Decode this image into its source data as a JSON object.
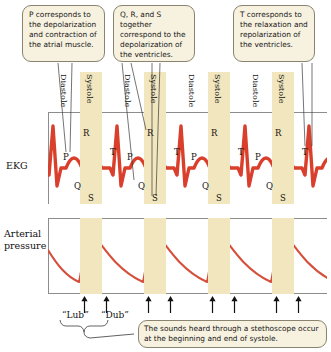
{
  "figure": {
    "accent_red": "#d93f2b",
    "band_color": "#f2e6bf",
    "callout_fill": "#f7f2e0",
    "callout_border": "#8a8370"
  },
  "callouts": {
    "p_wave": "P corresponds to the depolarization and contraction of the atrial muscle.",
    "qrs_complex": "Q, R, and S together correspond to the depolarization of the ventricles.",
    "t_wave": "T corresponds to the relaxation and repolarization of the ventricles.",
    "heart_sounds": "The sounds heard through a stethoscope occur at the beginning and end of systole."
  },
  "axis_titles": {
    "ekg": "EKG",
    "arterial_pressure_line1": "Arterial",
    "arterial_pressure_line2": "pressure"
  },
  "cycle_phases": [
    {
      "label": "Diastole",
      "x": 60
    },
    {
      "label": "Systole",
      "x": 86
    },
    {
      "label": "Diastole",
      "x": 124
    },
    {
      "label": "Systole",
      "x": 150
    },
    {
      "label": "Diastole",
      "x": 188
    },
    {
      "label": "Systole",
      "x": 214
    },
    {
      "label": "Diastole",
      "x": 252
    },
    {
      "label": "Systole",
      "x": 278
    }
  ],
  "systole_bands": [
    {
      "x": 80,
      "width": 22
    },
    {
      "x": 144,
      "width": 22
    },
    {
      "x": 208,
      "width": 22
    },
    {
      "x": 272,
      "width": 22
    }
  ],
  "wave_letters": [
    {
      "letter": "P",
      "x": 63,
      "y": 152
    },
    {
      "letter": "R",
      "x": 83,
      "y": 128
    },
    {
      "letter": "Q",
      "x": 74,
      "y": 181
    },
    {
      "letter": "S",
      "x": 88,
      "y": 193
    },
    {
      "letter": "T",
      "x": 110,
      "y": 147
    },
    {
      "letter": "P",
      "x": 127,
      "y": 152
    },
    {
      "letter": "R",
      "x": 147,
      "y": 128
    },
    {
      "letter": "Q",
      "x": 138,
      "y": 181
    },
    {
      "letter": "S",
      "x": 152,
      "y": 193
    },
    {
      "letter": "T",
      "x": 174,
      "y": 147
    },
    {
      "letter": "P",
      "x": 191,
      "y": 152
    },
    {
      "letter": "R",
      "x": 211,
      "y": 128
    },
    {
      "letter": "Q",
      "x": 202,
      "y": 181
    },
    {
      "letter": "S",
      "x": 216,
      "y": 193
    },
    {
      "letter": "T",
      "x": 238,
      "y": 147
    },
    {
      "letter": "P",
      "x": 255,
      "y": 152
    },
    {
      "letter": "R",
      "x": 275,
      "y": 128
    },
    {
      "letter": "Q",
      "x": 266,
      "y": 181
    },
    {
      "letter": "S",
      "x": 280,
      "y": 193
    },
    {
      "letter": "T",
      "x": 302,
      "y": 147
    }
  ],
  "heart_sounds": {
    "first_sound_label": "“Lub”",
    "second_sound_label": "“Dub”",
    "arrow_positions": [
      84,
      106,
      148,
      170,
      212,
      234,
      276,
      298
    ]
  },
  "chart_data": [
    {
      "type": "line",
      "name": "EKG",
      "title": "EKG",
      "xlabel": "",
      "ylabel": "EKG",
      "grid": false,
      "legend": "none",
      "series": [
        {
          "name": "EKG trace",
          "color": "#d93f2b",
          "cycle_period_px": 64,
          "waves": [
            "P",
            "Q",
            "R",
            "S",
            "T"
          ],
          "annotations": [
            "P = atrial depolarization and contraction",
            "Q, R, S = ventricular depolarization",
            "T = ventricular relaxation and repolarization"
          ]
        }
      ]
    },
    {
      "type": "line",
      "name": "Arterial pressure",
      "title": "Arterial pressure",
      "xlabel": "",
      "ylabel": "Arterial pressure",
      "grid": false,
      "legend": "none",
      "series": [
        {
          "name": "Arterial pressure trace",
          "color": "#d4503c",
          "cycle_period_px": 64,
          "shape": "sharp systolic upstroke to peak, then exponential diastolic decay to trough"
        }
      ]
    }
  ]
}
